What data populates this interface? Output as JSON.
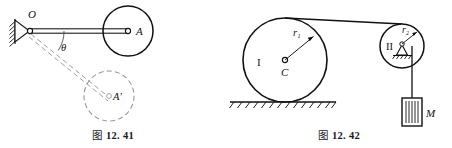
{
  "page": {
    "width": 452,
    "height": 148,
    "background": "#ffffff",
    "ink": "#111111",
    "ghost": "#9a9a9a"
  },
  "figures": [
    {
      "id": "fig-12-41",
      "caption_prefix": "图",
      "caption_number": "12. 41",
      "caption_full": "图 12. 41",
      "description": "Rigid rod pivoted at O carrying a disc at A, shown swung down by angle theta to dashed position A prime",
      "labels": {
        "pivot": "O",
        "disc_center": "A",
        "disc_center_ghost": "A'",
        "angle": "θ"
      },
      "geometry": {
        "pivot": [
          30,
          31
        ],
        "disc_center": [
          128,
          31
        ],
        "disc_radius": 25,
        "ghost_disc_center": [
          109,
          96
        ],
        "ghost_disc_radius": 25,
        "rod_half_thickness": 2.2,
        "hinge_circle_radius": 2.6,
        "angle_arc_radius": 34,
        "angle_degrees": 34
      }
    },
    {
      "id": "fig-12-42",
      "caption_prefix": "图",
      "caption_number": "12. 42",
      "caption_full": "图 12. 42",
      "description": "Cylinder I of radius r1 rolling on ground, cord from its top over fixed pulley II of radius r2 supporting hanging block M",
      "labels": {
        "cylinder": "I",
        "cylinder_center": "C",
        "cylinder_radius": "r₁",
        "pulley": "II",
        "pulley_radius": "r₂",
        "block": "M"
      },
      "geometry": {
        "cylinder_center": [
          59,
          60
        ],
        "cylinder_radius": 42,
        "ground_y": 102,
        "ground_x0": 4,
        "ground_x1": 110,
        "pulley_center": [
          176,
          46
        ],
        "pulley_radius": 22,
        "rope_top_start": [
          59,
          18
        ],
        "rope_top_end": [
          176,
          24
        ],
        "rope_drop_x": 186,
        "rope_drop_y0": 46,
        "rope_drop_y1": 98,
        "block_rect": [
          176,
          98,
          20,
          28
        ]
      }
    }
  ]
}
